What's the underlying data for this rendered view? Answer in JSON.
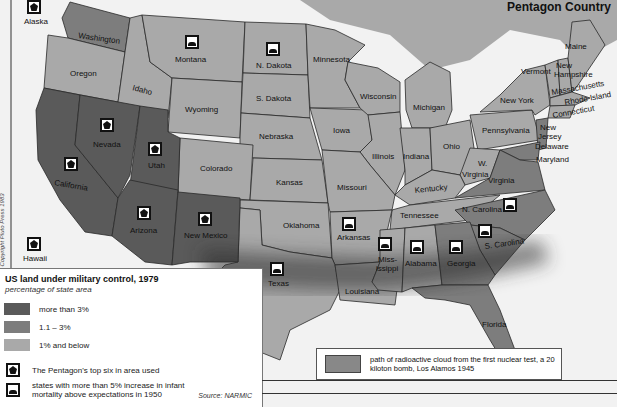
{
  "title": "Pentagon Country",
  "copyright": "© Copyright Pluto Press 1983",
  "colors": {
    "more_than_3": "#5a5a5a",
    "between_1_3": "#7d7d7d",
    "below_1": "#a9a9a9",
    "water": "#f2f2f2",
    "cloud": "#3a3a3a"
  },
  "legend": {
    "title": "US land under military control, 1979",
    "subtitle": "percentage   of state area",
    "categories": [
      {
        "label": "more than 3%",
        "color": "#5a5a5a"
      },
      {
        "label": "1.1 – 3%",
        "color": "#7d7d7d"
      },
      {
        "label": "1% and below",
        "color": "#a9a9a9"
      }
    ],
    "symbols": [
      {
        "icon": "pentagon-icon",
        "label": "The Pentagon's top six in area used"
      },
      {
        "icon": "infant-mortality-icon",
        "label": "states with more than 5% increase in infant mortality above expectations in 1950"
      }
    ],
    "source": "Source: NARMIC"
  },
  "cloud_legend": {
    "label": "path of radioactive cloud from the first nuclear test, a 20 kiloton bomb, Los Alamos 1945"
  },
  "states": [
    {
      "name": "Washington",
      "category": "1.1-3%"
    },
    {
      "name": "Oregon",
      "category": "1% and below"
    },
    {
      "name": "Idaho",
      "category": "1% and below"
    },
    {
      "name": "Montana",
      "category": "1% and below",
      "symbol": "infant-mortality"
    },
    {
      "name": "Wyoming",
      "category": "1% and below"
    },
    {
      "name": "N. Dakota",
      "category": "1% and below",
      "symbol": "infant-mortality"
    },
    {
      "name": "S. Dakota",
      "category": "1% and below"
    },
    {
      "name": "Minnesota",
      "category": "1% and below"
    },
    {
      "name": "Wisconsin",
      "category": "1% and below"
    },
    {
      "name": "Michigan",
      "category": "1% and below"
    },
    {
      "name": "Nebraska",
      "category": "1% and below"
    },
    {
      "name": "Iowa",
      "category": "1% and below"
    },
    {
      "name": "Illinois",
      "category": "1% and below"
    },
    {
      "name": "Indiana",
      "category": "1% and below"
    },
    {
      "name": "Ohio",
      "category": "1% and below"
    },
    {
      "name": "Colorado",
      "category": "1% and below"
    },
    {
      "name": "Kansas",
      "category": "1% and below"
    },
    {
      "name": "Missouri",
      "category": "1% and below"
    },
    {
      "name": "Kentucky",
      "category": "1% and below"
    },
    {
      "name": "W. Virginia",
      "category": "1% and below"
    },
    {
      "name": "Virginia",
      "category": "1.1-3%"
    },
    {
      "name": "Maryland",
      "category": "1.1-3%"
    },
    {
      "name": "Delaware",
      "category": "1% and below"
    },
    {
      "name": "New Jersey",
      "category": "1.1-3%"
    },
    {
      "name": "Pennsylvania",
      "category": "1% and below"
    },
    {
      "name": "New York",
      "category": "1% and below"
    },
    {
      "name": "Vermont",
      "category": "1% and below"
    },
    {
      "name": "New Hampshire",
      "category": "1% and below"
    },
    {
      "name": "Maine",
      "category": "1% and below"
    },
    {
      "name": "Massachusetts",
      "category": "1% and below"
    },
    {
      "name": "Rhode Island",
      "category": "1% and below"
    },
    {
      "name": "Connecticut",
      "category": "1% and below"
    },
    {
      "name": "California",
      "category": "more than 3%",
      "symbol": "pentagon"
    },
    {
      "name": "Nevada",
      "category": "more than 3%",
      "symbol": "pentagon"
    },
    {
      "name": "Utah",
      "category": "more than 3%",
      "symbol": "pentagon"
    },
    {
      "name": "Arizona",
      "category": "more than 3%",
      "symbol": "pentagon"
    },
    {
      "name": "New Mexico",
      "category": "more than 3%",
      "symbol": "pentagon"
    },
    {
      "name": "Oklahoma",
      "category": "1% and below"
    },
    {
      "name": "Texas",
      "category": "1% and below",
      "symbol": "infant-mortality"
    },
    {
      "name": "Arkansas",
      "category": "1% and below",
      "symbol": "infant-mortality"
    },
    {
      "name": "Louisiana",
      "category": "1% and below"
    },
    {
      "name": "Tennessee",
      "category": "1% and below"
    },
    {
      "name": "Mississippi",
      "category": "1% and below",
      "symbol": "infant-mortality"
    },
    {
      "name": "Alabama",
      "category": "1% and below",
      "symbol": "infant-mortality"
    },
    {
      "name": "Georgia",
      "category": "1.1-3%",
      "symbol": "infant-mortality"
    },
    {
      "name": "Florida",
      "category": "1.1-3%"
    },
    {
      "name": "N. Carolina",
      "category": "1.1-3%",
      "symbol": "infant-mortality"
    },
    {
      "name": "S. Carolina",
      "category": "1.1-3%",
      "symbol": "infant-mortality"
    },
    {
      "name": "Alaska",
      "category": "inset",
      "symbol": "pentagon"
    },
    {
      "name": "Hawaii",
      "category": "inset",
      "symbol": "pentagon"
    }
  ],
  "labels": {
    "washington": "Washington",
    "oregon": "Oregon",
    "idaho": "Idaho",
    "montana": "Montana",
    "wyoming": "Wyoming",
    "ndakota": "N. Dakota",
    "sdakota": "S. Dakota",
    "minnesota": "Minnesota",
    "wisconsin": "Wisconsin",
    "michigan": "Michigan",
    "nebraska": "Nebraska",
    "iowa": "Iowa",
    "illinois": "Illinois",
    "indiana": "Indiana",
    "ohio": "Ohio",
    "colorado": "Colorado",
    "kansas": "Kansas",
    "missouri": "Missouri",
    "kentucky": "Kentucky",
    "wv1": "W.",
    "wv2": "Virginia",
    "virginia": "Virginia",
    "maryland": "Maryland",
    "delaware": "Delaware",
    "nj1": "New",
    "nj2": "Jersey",
    "pennsylvania": "Pennsylvania",
    "newyork": "New York",
    "vermont": "Vermont",
    "nh1": "New",
    "nh2": "Hampshire",
    "maine": "Maine",
    "massachusetts": "Massachusetts",
    "rhodeisland": "Rhode Island",
    "connecticut": "Connecticut",
    "california": "California",
    "nevada": "Nevada",
    "utah": "Utah",
    "arizona": "Arizona",
    "newmexico": "New Mexico",
    "oklahoma": "Oklahoma",
    "texas": "Texas",
    "arkansas": "Arkansas",
    "louisiana": "Louisiana",
    "tennessee": "Tennessee",
    "ms1": "Miss-",
    "ms2": "issippi",
    "alabama": "Alabama",
    "georgia": "Georgia",
    "florida": "Florida",
    "ncarolina": "N. Carolina",
    "scarolina": "S. Carolina",
    "alaska": "Alaska",
    "hawaii": "Hawaii"
  }
}
